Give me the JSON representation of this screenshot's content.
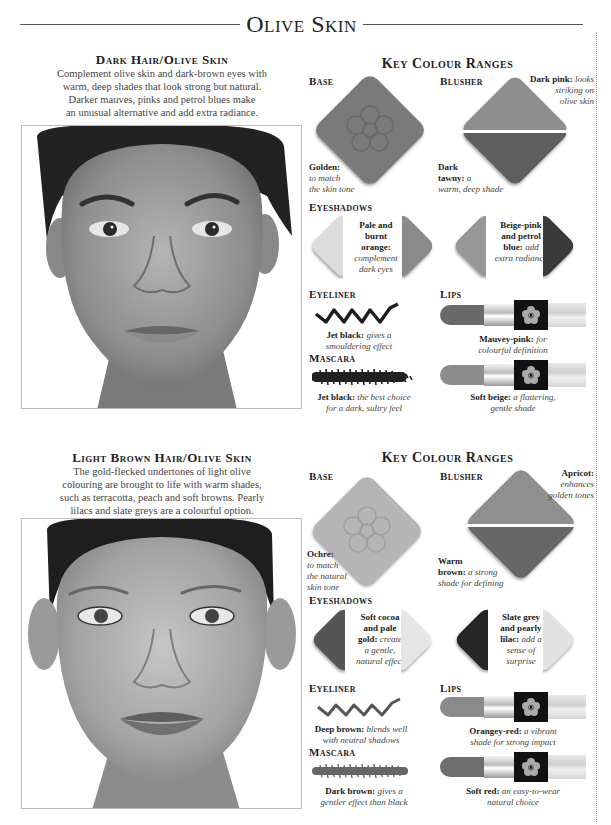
{
  "page": {
    "title": "Olive Skin"
  },
  "sections": [
    {
      "heading": "Dark Hair/Olive Skin",
      "description_lines": [
        "Complement olive skin and dark-brown eyes with",
        "warm, deep shades that look strong but natural.",
        "Darker mauves, pinks and petrol blues make",
        "an unusual alternative and add extra radiance."
      ],
      "photo_alt": "Portrait of woman with dark hair and olive skin",
      "key_colour_heading": "Key Colour Ranges",
      "base": {
        "label": "Base",
        "name": "Golden:",
        "note_lines": [
          "to match",
          "the skin tone"
        ],
        "color": "#7a7a7a"
      },
      "blusher": {
        "label": "Blusher",
        "top_name": "Dark pink:",
        "top_note": [
          "looks",
          "striking on",
          "olive skin"
        ],
        "bottom_name_lines": [
          "Dark",
          "tawny:"
        ],
        "bottom_note": [
          "a",
          "warm, deep shade"
        ],
        "top_color": "#8e8e8e",
        "bottom_color": "#5e5e5e"
      },
      "eyeshadows": {
        "label": "Eyeshadows",
        "pair1": {
          "name_lines": [
            "Pale and",
            "burnt",
            "orange:"
          ],
          "note_lines": [
            "complement",
            "dark eyes"
          ],
          "left_color": "#dcdcdc",
          "right_color": "#8a8a8a"
        },
        "pair2": {
          "name_lines": [
            "Beige-pink",
            "and petrol",
            "blue:"
          ],
          "note_lines": [
            "add",
            "extra radiance"
          ],
          "left_color": "#979797",
          "right_color": "#3a3a3a"
        }
      },
      "eyeliner": {
        "label": "Eyeliner",
        "name": "Jet black:",
        "note_lines": [
          "gives a",
          "smouldering effect"
        ],
        "color": "#1e1e1e"
      },
      "mascara": {
        "label": "Mascara",
        "name": "Jet black:",
        "note_lines": [
          "the best choice",
          "for a dark, sultry feel"
        ],
        "color": "#222222"
      },
      "lips": {
        "label": "Lips",
        "items": [
          {
            "name": "Mauvey-pink:",
            "note_lines": [
              "for",
              "colourful definition"
            ],
            "color": "#6a6a6a"
          },
          {
            "name": "Soft beige:",
            "note_lines": [
              "a flattering,",
              "gentle shade"
            ],
            "color": "#8c8c8c"
          }
        ]
      }
    },
    {
      "heading": "Light Brown Hair/Olive Skin",
      "description_lines": [
        "The gold-flecked undertones of light olive",
        "colouring are brought to life with warm shades,",
        "such as terracotta, peach and soft browns. Pearly",
        "lilacs and slate greys are a colourful option."
      ],
      "photo_alt": "Portrait of woman with light brown hair and olive skin",
      "key_colour_heading": "Key Colour Ranges",
      "base": {
        "label": "Base",
        "name": "Ochre:",
        "note_lines": [
          "to match",
          "the natural",
          "skin tone"
        ],
        "color": "#b5b5b5"
      },
      "blusher": {
        "label": "Blusher",
        "top_name": "Apricot:",
        "top_note": [
          "enhances",
          "golden tones"
        ],
        "bottom_name_lines": [
          "Warm",
          "brown:"
        ],
        "bottom_note": [
          "a strong",
          "shade for defining"
        ],
        "top_color": "#8f8f8f",
        "bottom_color": "#666666"
      },
      "eyeshadows": {
        "label": "Eyeshadows",
        "pair1": {
          "name_lines": [
            "Soft cocoa",
            "and pale",
            "gold:"
          ],
          "note_lines": [
            "create",
            "a gentle,",
            "natural effect"
          ],
          "left_color": "#555555",
          "right_color": "#e6e6e6"
        },
        "pair2": {
          "name_lines": [
            "Slate grey",
            "and pearly",
            "lilac:"
          ],
          "note_lines": [
            "add a",
            "sense of",
            "surprise"
          ],
          "left_color": "#262626",
          "right_color": "#e2e2e2"
        }
      },
      "eyeliner": {
        "label": "Eyeliner",
        "name": "Deep brown:",
        "note_lines": [
          "blends well",
          "with neutral shadows"
        ],
        "color": "#555555"
      },
      "mascara": {
        "label": "Mascara",
        "name": "Dark brown:",
        "note_lines": [
          "gives a",
          "gentler effect than black"
        ],
        "color": "#666666"
      },
      "lips": {
        "label": "Lips",
        "items": [
          {
            "name": "Orangey-red:",
            "note_lines": [
              "a vibrant",
              "shade for strong impact"
            ],
            "color": "#8a8a8a"
          },
          {
            "name": "Soft red:",
            "note_lines": [
              "an easy-to-wear",
              "natural choice"
            ],
            "color": "#6e6e6e"
          }
        ]
      }
    }
  ]
}
